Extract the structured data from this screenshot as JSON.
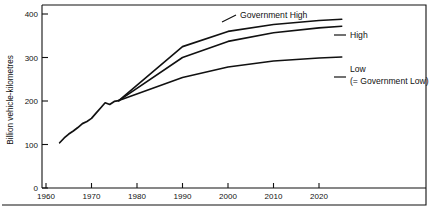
{
  "chart_data": {
    "type": "line",
    "title": "",
    "xlabel": "",
    "ylabel": "Billion vehicle-kilometres",
    "xlim": [
      1958,
      2028
    ],
    "ylim": [
      0,
      430
    ],
    "xticks": [
      1960,
      1970,
      1980,
      1990,
      2000,
      2010,
      2020
    ],
    "xtick_labels": [
      "1960",
      "1970",
      "1980",
      "1990",
      "2000",
      "2010",
      "2020"
    ],
    "yticks": [
      0,
      100,
      200,
      300,
      400
    ],
    "ytick_labels": [
      "0",
      "100",
      "200",
      "300",
      "400"
    ],
    "grid": false,
    "legend_position": "inline-annotations",
    "series": [
      {
        "name": "Historical",
        "label": "",
        "x": [
          1963,
          1964,
          1965,
          1966,
          1967,
          1968,
          1969,
          1970,
          1971,
          1972,
          1973,
          1974,
          1975,
          1976
        ],
        "values": [
          104,
          115,
          124,
          131,
          139,
          148,
          153,
          160,
          172,
          184,
          196,
          192,
          199,
          201
        ]
      },
      {
        "name": "Government High",
        "label": "Government High",
        "x": [
          1976,
          1990,
          2000,
          2010,
          2020,
          2025
        ],
        "values": [
          201,
          325,
          360,
          376,
          385,
          388
        ]
      },
      {
        "name": "High",
        "label": "High",
        "x": [
          1976,
          1990,
          2000,
          2010,
          2020,
          2025
        ],
        "values": [
          201,
          300,
          337,
          357,
          368,
          372
        ]
      },
      {
        "name": "Low",
        "label": "Low",
        "sublabel": "(= Government Low)",
        "x": [
          1976,
          1990,
          2000,
          2010,
          2020,
          2025
        ],
        "values": [
          201,
          254,
          278,
          292,
          299,
          301
        ]
      }
    ],
    "annotations": [
      {
        "text": "Government High",
        "series": "Government High"
      },
      {
        "text": "High",
        "series": "High"
      },
      {
        "text": "Low",
        "series": "Low"
      },
      {
        "text": "(= Government Low)",
        "series": "Low"
      }
    ]
  }
}
